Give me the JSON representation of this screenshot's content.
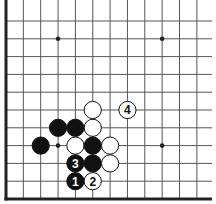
{
  "board": {
    "description": "Go board fragment (lower-left corner region)",
    "columns": 12,
    "rows": 11,
    "origin_x": 6,
    "origin_y": 21,
    "spacing_x": 17.35,
    "spacing_y": 17.8,
    "edges": [
      "left",
      "bottom"
    ],
    "star_points": [
      [
        3,
        1
      ],
      [
        9,
        1
      ],
      [
        3,
        7
      ],
      [
        9,
        7
      ]
    ],
    "stones": [
      {
        "col": 5,
        "row": 5,
        "color": "white",
        "label": ""
      },
      {
        "col": 7,
        "row": 5,
        "color": "white",
        "label": "4"
      },
      {
        "col": 3,
        "row": 6,
        "color": "black",
        "label": ""
      },
      {
        "col": 4,
        "row": 6,
        "color": "black",
        "label": ""
      },
      {
        "col": 5,
        "row": 6,
        "color": "white",
        "label": ""
      },
      {
        "col": 2,
        "row": 7,
        "color": "black",
        "label": ""
      },
      {
        "col": 4,
        "row": 7,
        "color": "white",
        "label": ""
      },
      {
        "col": 5,
        "row": 7,
        "color": "black",
        "label": ""
      },
      {
        "col": 6,
        "row": 7,
        "color": "white",
        "label": ""
      },
      {
        "col": 4,
        "row": 8,
        "color": "black",
        "label": "3"
      },
      {
        "col": 5,
        "row": 8,
        "color": "black",
        "label": ""
      },
      {
        "col": 6,
        "row": 8,
        "color": "white",
        "label": ""
      },
      {
        "col": 4,
        "row": 9,
        "color": "black",
        "label": "1"
      },
      {
        "col": 5,
        "row": 9,
        "color": "white",
        "label": "2"
      }
    ],
    "colors": {
      "line": "#555555",
      "edge": "#222222",
      "black": "#111111",
      "white": "#ffffff"
    }
  }
}
